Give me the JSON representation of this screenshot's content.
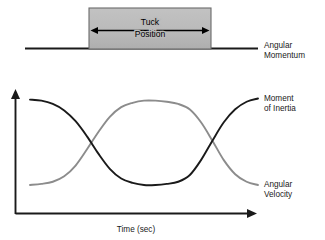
{
  "figure": {
    "title": "",
    "tuck_box": {
      "label_line1": "Tuck",
      "label_line2": "Position",
      "fill_color": "#b9b9b9",
      "border_color": "#6b6b6b"
    },
    "momentum_line": {
      "label_line1": "Angular",
      "label_line2": "Momentum",
      "color": "#1a1a1a"
    }
  },
  "chart_data": {
    "type": "line",
    "title": "",
    "xlabel": "Time (sec)",
    "ylabel": "",
    "xlim": [
      0,
      100
    ],
    "ylim": [
      0,
      100
    ],
    "grid": false,
    "legend": "right-inline",
    "annotations": [
      "Tuck Position",
      "Angular Momentum"
    ],
    "x": [
      0,
      5,
      10,
      15,
      20,
      25,
      30,
      35,
      40,
      45,
      50,
      55,
      60,
      65,
      70,
      75,
      80,
      85,
      90,
      95,
      100
    ],
    "series": [
      {
        "name": "Moment of Inertia",
        "label_line1": "Moment",
        "label_line2": "of Inertia",
        "color": "#1a1a1a",
        "values": [
          92,
          91,
          88,
          82,
          72,
          58,
          42,
          28,
          19,
          15,
          13,
          13,
          14,
          16,
          22,
          36,
          54,
          71,
          83,
          90,
          93
        ]
      },
      {
        "name": "Angular Velocity",
        "label_line1": "Angular",
        "label_line2": "Velocity",
        "color": "#8c8c8c",
        "values": [
          13,
          14,
          16,
          21,
          31,
          46,
          62,
          76,
          85,
          89,
          91,
          91,
          90,
          88,
          83,
          71,
          54,
          36,
          23,
          16,
          13
        ]
      }
    ]
  }
}
